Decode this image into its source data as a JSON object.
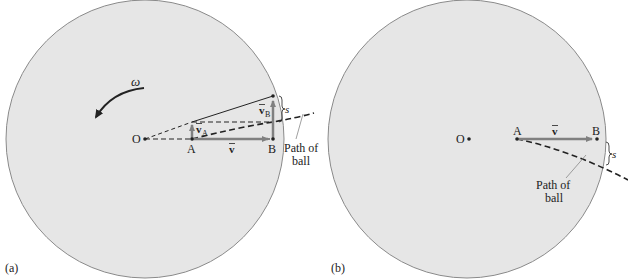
{
  "colors": {
    "disk_fill": "#e6e6e6",
    "disk_stroke": "#8a8a8a",
    "vector": "#808080",
    "ink": "#222222",
    "leader": "#888888"
  },
  "panel_a": {
    "caption": "(a)",
    "omega_label": "ω",
    "origin_label": "O",
    "point_a_label": "A",
    "point_b_label": "B",
    "velocity_label": "v",
    "velocity_a_label": "v",
    "velocity_a_sub": "A",
    "velocity_b_label": "v",
    "velocity_b_sub": "B",
    "s_label": "s",
    "path_label_line1": "Path of",
    "path_label_line2": "ball"
  },
  "panel_b": {
    "caption": "(b)",
    "origin_label": "O",
    "point_a_label": "A",
    "point_b_label": "B",
    "velocity_label": "v",
    "s_label": "s",
    "path_label_line1": "Path of",
    "path_label_line2": "ball"
  }
}
